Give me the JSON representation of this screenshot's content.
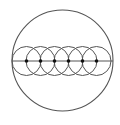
{
  "diagram": {
    "colors": {
      "background": "#ffffff",
      "stroke": "#555555",
      "dot": "#111111"
    },
    "outer_circle": {
      "cx": 62.5,
      "cy": 60.5,
      "r": 50.5
    },
    "diameter_line": {
      "x1": 12,
      "y1": 61,
      "x2": 113,
      "y2": 61
    },
    "small_circles": [
      {
        "cx": 26.5,
        "cy": 61,
        "r": 14.5
      },
      {
        "cx": 40.5,
        "cy": 61,
        "r": 14.5
      },
      {
        "cx": 54.5,
        "cy": 61,
        "r": 14.5
      },
      {
        "cx": 68.5,
        "cy": 61,
        "r": 14.5
      },
      {
        "cx": 82.5,
        "cy": 61,
        "r": 14.5
      },
      {
        "cx": 96.5,
        "cy": 61,
        "r": 14.5
      }
    ],
    "center_dots": [
      {
        "cx": 26.5,
        "cy": 61,
        "r": 1.8
      },
      {
        "cx": 40.5,
        "cy": 61,
        "r": 1.8
      },
      {
        "cx": 54.5,
        "cy": 61,
        "r": 1.8
      },
      {
        "cx": 68.5,
        "cy": 61,
        "r": 1.8
      },
      {
        "cx": 82.5,
        "cy": 61,
        "r": 1.8
      },
      {
        "cx": 96.5,
        "cy": 61,
        "r": 1.8
      }
    ]
  }
}
